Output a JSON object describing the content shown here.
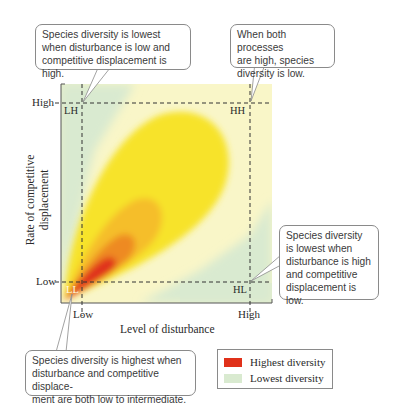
{
  "figure": {
    "axes": {
      "x_title": "Level of disturbance",
      "y_title_line1": "Rate of competitive",
      "y_title_line2": "displacement",
      "x_ticks": [
        "Low",
        "High"
      ],
      "y_ticks": [
        "High",
        "Low"
      ]
    },
    "quadrants": {
      "LH": "LH",
      "HH": "HH",
      "LL": "LL",
      "HL": "HL"
    },
    "callouts": {
      "top_left": {
        "line1": "Species diversity is lowest",
        "line2": "when disturbance is low and",
        "line3": "competitive displacement is high."
      },
      "top_right": {
        "line1": "When both processes",
        "line2": "are high, species",
        "line3": "diversity is low."
      },
      "right": {
        "line1": "Species diversity",
        "line2": "is lowest when",
        "line3": "disturbance is high",
        "line4": "and competitive",
        "line5": "displacement is low."
      },
      "bottom_left": {
        "line1": "Species diversity is highest when",
        "line2": "disturbance and competitive displace-",
        "line3": "ment are both low to intermediate."
      }
    },
    "legend": {
      "items": [
        {
          "label": "Highest diversity",
          "color": "#e0311a"
        },
        {
          "label": "Lowest diversity",
          "color": "#d9ead0"
        }
      ]
    },
    "colors": {
      "lowest_green": "#d9ead0",
      "pale_yellow": "#f9f6c8",
      "yellow": "#f7e32a",
      "light_orange": "#f5be2c",
      "orange": "#ee8a22",
      "red": "#e0311a"
    }
  }
}
